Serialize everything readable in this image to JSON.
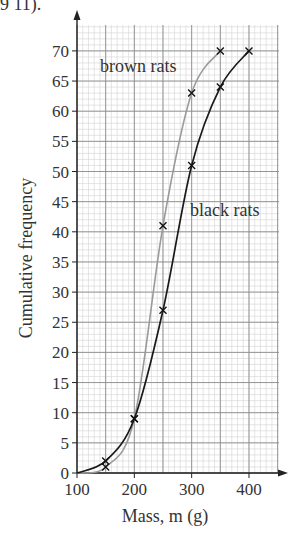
{
  "header_fragment": "9 11).",
  "chart_data": {
    "type": "line",
    "title": "",
    "xlabel": "Mass, m (g)",
    "ylabel": "Cumulative frequency",
    "xlim": [
      100,
      450
    ],
    "ylim": [
      0,
      75
    ],
    "xticks": [
      100,
      200,
      300,
      400
    ],
    "yticks": [
      0,
      5,
      10,
      15,
      20,
      25,
      30,
      35,
      40,
      45,
      50,
      55,
      60,
      65,
      70
    ],
    "grid": true,
    "legend": "inline labels",
    "series": [
      {
        "name": "brown rats",
        "color": "#9a9a9a",
        "x": [
          100,
          150,
          200,
          250,
          300,
          350
        ],
        "y": [
          0,
          1,
          9,
          41,
          63,
          70
        ]
      },
      {
        "name": "black rats",
        "color": "#1a1a1a",
        "x": [
          100,
          150,
          200,
          250,
          300,
          350,
          400
        ],
        "y": [
          0,
          2,
          9,
          27,
          51,
          64,
          70
        ]
      }
    ]
  }
}
